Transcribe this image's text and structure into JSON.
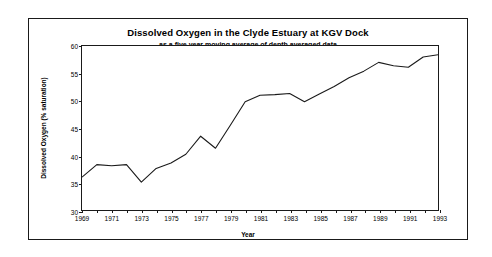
{
  "chart_data": {
    "type": "line",
    "title": "Dissolved Oxygen in the Clyde Estuary at KGV Dock",
    "subtitle": "as a five year moving average of depth averaged data",
    "xlabel": "Year",
    "ylabel": "Dissolved Oxygen (% saturation)",
    "xlim": [
      1969,
      1993
    ],
    "ylim": [
      30,
      60
    ],
    "yticks": [
      30,
      35,
      40,
      45,
      50,
      55,
      60
    ],
    "xticks": [
      1969,
      1970,
      1971,
      1972,
      1973,
      1974,
      1975,
      1976,
      1977,
      1978,
      1979,
      1980,
      1981,
      1982,
      1983,
      1984,
      1985,
      1986,
      1987,
      1988,
      1989,
      1990,
      1991,
      1992,
      1993
    ],
    "xtick_labels": [
      1969,
      1971,
      1973,
      1975,
      1977,
      1979,
      1981,
      1983,
      1985,
      1987,
      1989,
      1991,
      1993
    ],
    "grid": false,
    "legend": false,
    "line_color": "#1a1a1a",
    "x": [
      1969,
      1970,
      1971,
      1972,
      1973,
      1974,
      1975,
      1976,
      1977,
      1978,
      1979,
      1980,
      1981,
      1982,
      1983,
      1984,
      1985,
      1986,
      1987,
      1988,
      1989,
      1990,
      1991,
      1992,
      1993
    ],
    "values": [
      36.0,
      38.3,
      38.1,
      38.3,
      35.1,
      37.6,
      38.6,
      40.2,
      43.5,
      41.3,
      45.5,
      49.8,
      51.0,
      51.1,
      51.3,
      49.8,
      51.2,
      52.6,
      54.2,
      55.4,
      57.0,
      56.4,
      56.1,
      58.0,
      58.4
    ]
  }
}
